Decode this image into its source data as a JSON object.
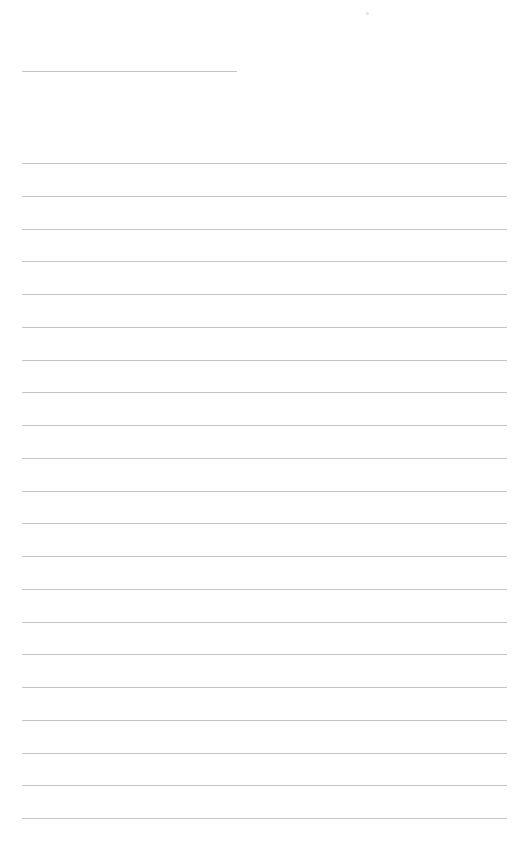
{
  "page": {
    "background": "#ffffff",
    "line_color": "#c4c4c4",
    "header_line": {
      "x": 22,
      "y": 71,
      "width": 215
    },
    "lines": {
      "x": 22,
      "width": 485,
      "start_y": 163,
      "spacing": 32.75,
      "count": 21
    }
  }
}
